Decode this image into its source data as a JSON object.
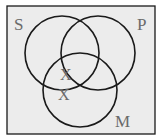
{
  "diagram": {
    "type": "venn",
    "background": "#ececec",
    "stroke": "#1a1a1a",
    "sets": [
      {
        "label": "S",
        "cx": 62,
        "cy": 53,
        "r": 37
      },
      {
        "label": "P",
        "cx": 98,
        "cy": 53,
        "r": 37
      },
      {
        "label": "M",
        "cx": 80,
        "cy": 90,
        "r": 37
      }
    ],
    "set_labels": {
      "s": "S",
      "p": "P",
      "m": "M"
    },
    "marks": [
      {
        "text": "X",
        "x": 66,
        "y": 77
      },
      {
        "text": "X",
        "x": 64,
        "y": 98
      }
    ]
  }
}
